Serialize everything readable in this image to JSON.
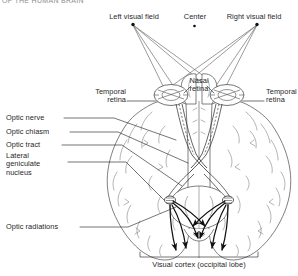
{
  "figure": {
    "title_fragment": "OF THE HUMAN BRAIN",
    "view": "inferior view of the brain showing the visual pathway"
  },
  "labels": {
    "left_visual_field": "Left visual field",
    "center": "Center",
    "right_visual_field": "Right visual field",
    "temporal_retina_left": "Temporal\nretina",
    "nasal_retina": "Nasal\nretina",
    "temporal_retina_right": "Temporal\nretina",
    "optic_nerve": "Optic nerve",
    "optic_chiasm": "Optic chiasm",
    "optic_tract": "Optic tract",
    "lateral_geniculate_nucleus": "Lateral\ngeniculate\nnucleus",
    "optic_radiations": "Optic radiations",
    "visual_cortex": "Visual cortex (occipital lobe)"
  },
  "colors": {
    "ink": "#1f1f1f",
    "outline": "#4a4a4a",
    "sulci": "#6e6e6e",
    "ray": "#5a5a5a",
    "leader": "#2a2a2a",
    "background": "#ffffff"
  },
  "markers": {
    "left_field_dot": "field-point-dot",
    "center_dot": "fixation-point-dot",
    "right_field_dot": "field-point-dot"
  }
}
